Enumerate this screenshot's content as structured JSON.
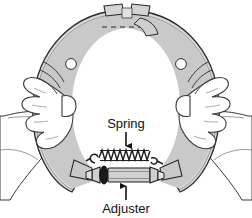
{
  "figure": {
    "background_color": "#ffffff",
    "line_color": "#2b2b2b",
    "shoe_web_fill": "#c9c9c9",
    "shoe_rim_fill": "#d8d8d8",
    "shoe_lining_fill": "#b9b9b9",
    "hand_fill": "#ffffff",
    "adjuster_body_fill": "#d0d0d0",
    "adjuster_ring_fill": "#1a1a1a",
    "spring_color": "#1f1f1f"
  },
  "labels": [
    {
      "id": "spring",
      "text": "Spring",
      "x": 126,
      "y": 128,
      "anchor": "middle",
      "arrow": {
        "direction": "down",
        "from_x": 126,
        "from_y": 132,
        "to_x": 126,
        "to_y": 150
      }
    },
    {
      "id": "adjuster",
      "text": "Adjuster",
      "x": 126,
      "y": 212,
      "anchor": "middle",
      "arrow": {
        "direction": "up",
        "from_x": 126,
        "from_y": 200,
        "to_x": 126,
        "to_y": 182
      }
    }
  ],
  "parts": [
    {
      "id": "brake-shoe",
      "name": "Brake shoe assembly"
    },
    {
      "id": "shoe-web",
      "name": "Shoe web"
    },
    {
      "id": "shoe-lining",
      "name": "Shoe lining"
    },
    {
      "id": "return-spring",
      "name": "Return spring"
    },
    {
      "id": "adjuster-screw",
      "name": "Adjuster screw"
    },
    {
      "id": "star-wheel",
      "name": "Star wheel"
    },
    {
      "id": "left-hand",
      "name": "Left hand"
    },
    {
      "id": "right-hand",
      "name": "Right hand"
    }
  ]
}
